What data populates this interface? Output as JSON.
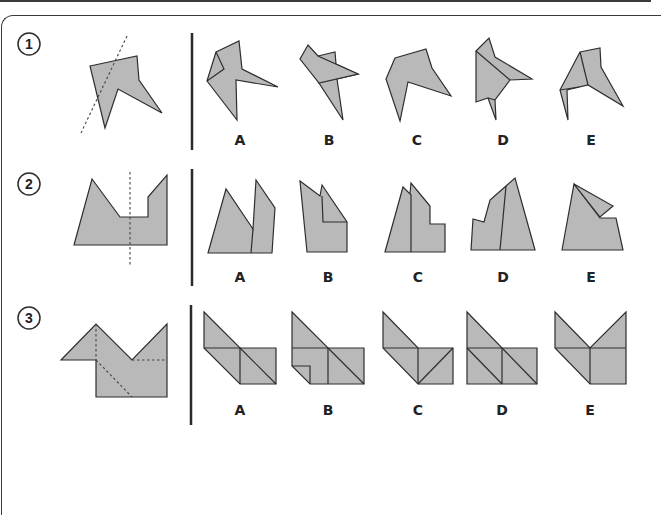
{
  "puzzle": {
    "fill_color": "#b9b9b9",
    "stroke_color": "#2e2e2e",
    "rows": [
      {
        "number": "1",
        "options": [
          {
            "label": "A"
          },
          {
            "label": "B"
          },
          {
            "label": "C"
          },
          {
            "label": "D"
          },
          {
            "label": "E"
          }
        ]
      },
      {
        "number": "2",
        "options": [
          {
            "label": "A"
          },
          {
            "label": "B"
          },
          {
            "label": "C"
          },
          {
            "label": "D"
          },
          {
            "label": "E"
          }
        ]
      },
      {
        "number": "3",
        "options": [
          {
            "label": "A"
          },
          {
            "label": "B"
          },
          {
            "label": "C"
          },
          {
            "label": "D"
          },
          {
            "label": "E"
          }
        ]
      }
    ]
  }
}
